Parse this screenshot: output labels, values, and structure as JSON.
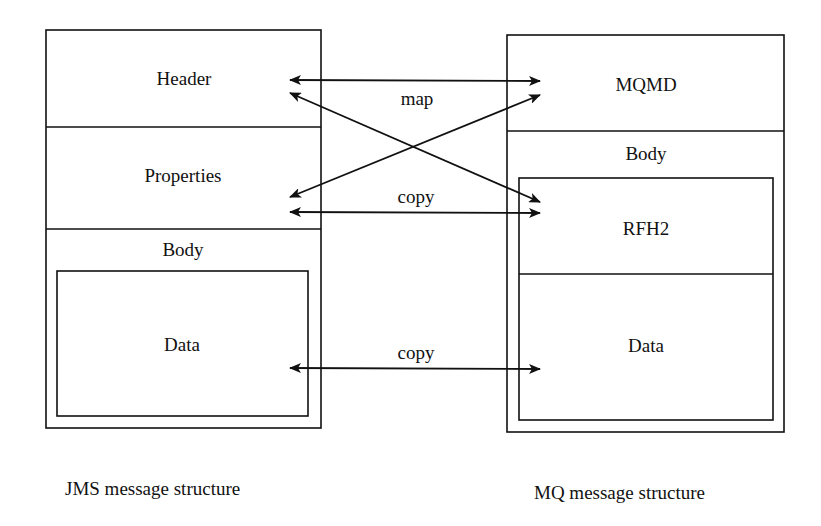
{
  "jms": {
    "header": "Header",
    "properties": "Properties",
    "body": "Body",
    "data": "Data",
    "caption": "JMS message structure"
  },
  "mq": {
    "mqmd": "MQMD",
    "body": "Body",
    "rfh2": "RFH2",
    "data": "Data",
    "caption": "MQ message structure"
  },
  "arrows": {
    "map": "map",
    "copy_properties": "copy",
    "copy_data": "copy"
  },
  "colors": {
    "line": "#111111",
    "background": "#ffffff"
  }
}
